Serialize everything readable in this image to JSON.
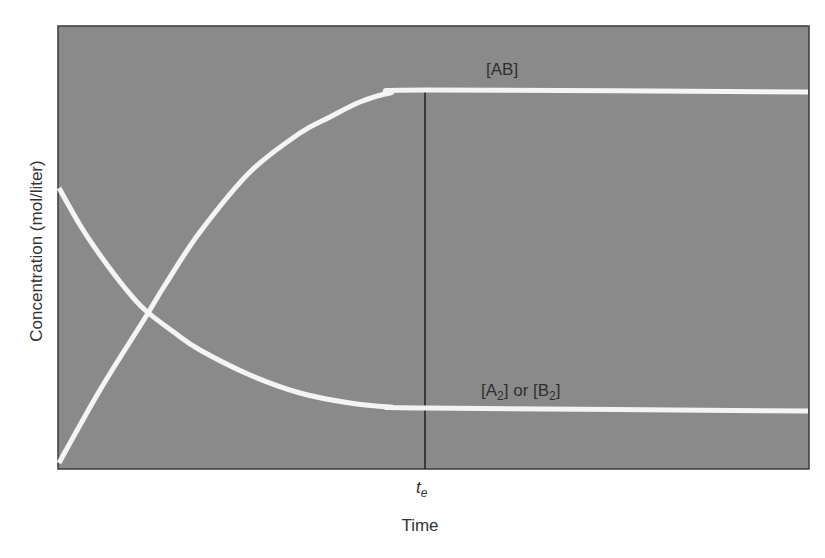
{
  "chart_data": {
    "type": "line",
    "title": "",
    "xlabel": "Time",
    "ylabel": "Concentration (mol/liter)",
    "grid": false,
    "legend": "inline labels",
    "background_color": "#8a8a8a",
    "line_color": "#f4f4f4",
    "annotations": [
      {
        "type": "vertical-line",
        "label": "t_e",
        "label_main": "t",
        "label_sub": "e",
        "x_fraction": 0.488
      }
    ],
    "series": [
      {
        "name": "[AB]",
        "label_main": "[AB]",
        "description": "rises from 0 and levels off at equilibrium time t_e",
        "points_px": [
          [
            59,
            463
          ],
          [
            100,
            390
          ],
          [
            145,
            318
          ],
          [
            165,
            285
          ],
          [
            200,
            232
          ],
          [
            250,
            172
          ],
          [
            300,
            133
          ],
          [
            330,
            117
          ],
          [
            360,
            102
          ],
          [
            390,
            93
          ],
          [
            425,
            90
          ],
          [
            808,
            92
          ]
        ]
      },
      {
        "name": "[A2] or [B2]",
        "label_parts": [
          "[A",
          "2",
          "] or [B",
          "2",
          "]"
        ],
        "description": "decreases from initial value and levels off at equilibrium time t_e",
        "points_px": [
          [
            59,
            188
          ],
          [
            80,
            225
          ],
          [
            100,
            255
          ],
          [
            125,
            288
          ],
          [
            145,
            310
          ],
          [
            175,
            333
          ],
          [
            200,
            350
          ],
          [
            250,
            375
          ],
          [
            300,
            393
          ],
          [
            350,
            403
          ],
          [
            390,
            407
          ],
          [
            425,
            408
          ],
          [
            808,
            411
          ]
        ]
      }
    ],
    "x_ticks": [
      "t_e"
    ],
    "y_ticks": []
  },
  "labels": {
    "ylabel": "Concentration (mol/liter)",
    "xlabel": "Time",
    "te_main": "t",
    "te_sub": "e",
    "ab": "[AB]",
    "a2_p1": "[A",
    "a2_s1": "2",
    "a2_p2": "] or [B",
    "a2_s2": "2",
    "a2_p3": "]"
  }
}
